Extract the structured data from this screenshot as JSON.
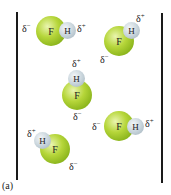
{
  "figure": {
    "caption": "(a)",
    "colors": {
      "fluorine": "#9cc32a",
      "hydrogen": "#c3cfd6",
      "wall": "#1a1a1a"
    },
    "molecules": [
      {
        "id": "m1",
        "F": "F",
        "H": "H",
        "delta_minus": "δ",
        "delta_plus": "δ",
        "minus": "−",
        "plus": "+"
      },
      {
        "id": "m2",
        "F": "F",
        "H": "H",
        "delta_minus": "δ",
        "delta_plus": "δ",
        "minus": "−",
        "plus": "+"
      },
      {
        "id": "m3",
        "F": "F",
        "H": "H",
        "delta_minus": "δ",
        "delta_plus": "δ",
        "minus": "−",
        "plus": "+"
      },
      {
        "id": "m4",
        "F": "F",
        "H": "H",
        "delta_minus": "δ",
        "delta_plus": "δ",
        "minus": "−",
        "plus": "+"
      },
      {
        "id": "m5",
        "F": "F",
        "H": "H",
        "delta_minus": "δ",
        "delta_plus": "δ",
        "minus": "−",
        "plus": "+"
      }
    ]
  }
}
